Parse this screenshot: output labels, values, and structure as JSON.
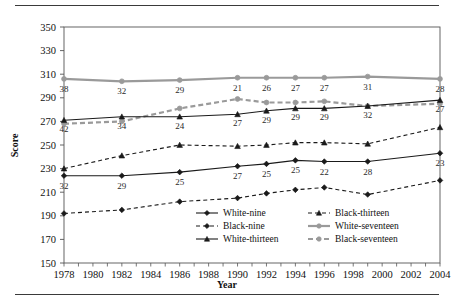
{
  "figure": {
    "top_rule": "",
    "bottom_rule": ""
  },
  "chart_data": {
    "type": "line",
    "title": "",
    "xlabel": "Year",
    "ylabel": "Score",
    "xlim": [
      1978,
      2004
    ],
    "ylim": [
      150,
      350
    ],
    "yticks": [
      150,
      170,
      190,
      210,
      230,
      250,
      270,
      290,
      310,
      330,
      350
    ],
    "xticks": [
      1978,
      1980,
      1982,
      1984,
      1986,
      1988,
      1990,
      1992,
      1994,
      1996,
      1998,
      2000,
      2002,
      2004
    ],
    "xtick_labels": [
      "1978",
      "1980",
      "1982",
      "1984",
      "1986",
      "1988",
      "1990",
      "1992",
      "1994",
      "1996",
      "1998",
      "2000",
      "2002",
      "2004"
    ],
    "ytick_labels": [
      "150",
      "170",
      "190",
      "210",
      "230",
      "250",
      "270",
      "290",
      "310",
      "330",
      "350"
    ],
    "grid": false,
    "legend_position": "lower-right-inside",
    "x": [
      1978,
      1982,
      1986,
      1990,
      1992,
      1994,
      1996,
      1999,
      2004
    ],
    "series": [
      {
        "name": "White-nine",
        "color": "#1a1a1a",
        "linestyle": "solid",
        "marker": "diamond",
        "values": [
          224,
          224,
          227,
          232,
          234,
          237,
          236,
          236,
          243
        ]
      },
      {
        "name": "Black-nine",
        "color": "#1a1a1a",
        "linestyle": "dashed",
        "marker": "diamond",
        "values": [
          192,
          195,
          202,
          205,
          209,
          212,
          214,
          208,
          220
        ]
      },
      {
        "name": "White-thirteen",
        "color": "#1a1a1a",
        "linestyle": "solid",
        "marker": "triangle",
        "values": [
          271,
          274,
          274,
          276,
          279,
          281,
          281,
          283,
          288
        ]
      },
      {
        "name": "Black-thirteen",
        "color": "#1a1a1a",
        "linestyle": "dashed",
        "marker": "triangle",
        "values": [
          230,
          241,
          250,
          249,
          250,
          252,
          252,
          251,
          265
        ]
      },
      {
        "name": "White-seventeen",
        "color": "#9a9a9a",
        "linestyle": "solid",
        "marker": "circle",
        "values": [
          306,
          304,
          305,
          307,
          307,
          307,
          307,
          308,
          306
        ]
      },
      {
        "name": "Black-seventeen",
        "color": "#9a9a9a",
        "linestyle": "dashed",
        "marker": "circle",
        "values": [
          268,
          270,
          281,
          289,
          286,
          286,
          287,
          283,
          285
        ]
      }
    ],
    "gap_labels": [
      {
        "series": "White-seventeen",
        "note": "white-black gap at age seventeen",
        "values": [
          "38",
          "32",
          "29",
          "21",
          "26",
          "27",
          "27",
          "31",
          "28"
        ]
      },
      {
        "series": "White-thirteen",
        "note": "white-black gap at age thirteen",
        "values": [
          "42",
          "34",
          "24",
          "27",
          "29",
          "29",
          "29",
          "32",
          "27"
        ]
      },
      {
        "series": "White-nine",
        "note": "white-black gap at age nine",
        "values": [
          "32",
          "29",
          "25",
          "27",
          "25",
          "25",
          "22",
          "28",
          "23"
        ]
      }
    ],
    "legend": [
      {
        "label": "White-nine",
        "color": "#1a1a1a",
        "linestyle": "solid",
        "marker": "diamond"
      },
      {
        "label": "Black-nine",
        "color": "#1a1a1a",
        "linestyle": "dashed",
        "marker": "diamond"
      },
      {
        "label": "White-thirteen",
        "color": "#1a1a1a",
        "linestyle": "solid",
        "marker": "triangle"
      },
      {
        "label": "Black-thirteen",
        "color": "#1a1a1a",
        "linestyle": "dashed",
        "marker": "triangle"
      },
      {
        "label": "White-seventeen",
        "color": "#9a9a9a",
        "linestyle": "solid",
        "marker": "circle"
      },
      {
        "label": "Black-seventeen",
        "color": "#9a9a9a",
        "linestyle": "dashed",
        "marker": "circle"
      }
    ]
  }
}
